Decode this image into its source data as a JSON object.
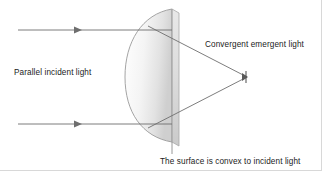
{
  "figure": {
    "type": "optics-ray-diagram",
    "background_color": "#ffffff",
    "width": 322,
    "height": 171
  },
  "labels": {
    "parallel_incident": "Parallel incident light",
    "convergent_emergent": "Convergent emergent light",
    "surface_convex": "The surface is convex to incident light"
  },
  "colors": {
    "ray_stroke": "#6e6e6e",
    "lens_outline": "#9a9a9a",
    "lens_fill_light": "#ffffff",
    "lens_fill_shadow": "#d9d9d9",
    "text": "#1b1b1b",
    "leader_line": "#8c8c8c",
    "frame": "#d8d8d8"
  },
  "geometry": {
    "lens": {
      "flat_face_x": 172,
      "top_y": 9,
      "bottom_y": 142,
      "curve_apex_x": 125,
      "curve_apex_y": 77
    },
    "focal_point": {
      "x": 247,
      "y": 77
    },
    "incident_rays": [
      {
        "name": "upper-ray",
        "y": 30,
        "x_start": 18,
        "x_end": 172,
        "arrow_x": 79
      },
      {
        "name": "lower-ray",
        "y": 124,
        "x_start": 18,
        "x_end": 172,
        "arrow_x": 79
      }
    ],
    "emergent_rays": [
      {
        "name": "upper-emergent",
        "x1": 150,
        "y1": 30,
        "x2": 247,
        "y2": 77
      },
      {
        "name": "lower-emergent",
        "x1": 150,
        "y1": 124,
        "x2": 247,
        "y2": 77
      }
    ],
    "leader_line": {
      "x": 172,
      "y_start": 142,
      "y_end": 153
    }
  }
}
